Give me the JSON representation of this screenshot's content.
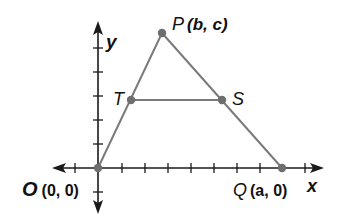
{
  "diagram": {
    "type": "coordinate-geometry-triangle",
    "axes": {
      "x_label": "x",
      "y_label": "y"
    },
    "points": {
      "O": {
        "name": "O",
        "coords": "(0, 0)"
      },
      "P": {
        "name": "P",
        "coords": "(b, c)"
      },
      "Q": {
        "name": "Q",
        "coords": "(a, 0)"
      },
      "T": {
        "name": "T"
      },
      "S": {
        "name": "S"
      }
    },
    "segments": [
      "OP",
      "PQ",
      "TS",
      "OQ"
    ],
    "colors": {
      "segment": "#7a7a7a",
      "point": "#6e6e6e",
      "axis": "#1a1a1a"
    }
  }
}
